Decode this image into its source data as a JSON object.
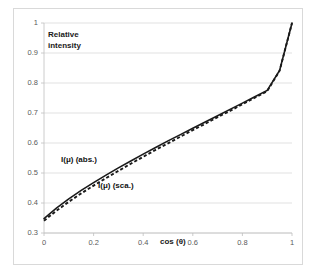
{
  "chart_data": {
    "type": "line",
    "title": "",
    "xlabel": "cos (θ)",
    "ylabel": "Relative intensity",
    "ylabel_line1": "Relative",
    "ylabel_line2": "intensity",
    "xlim": [
      0,
      1
    ],
    "ylim": [
      0.3,
      1
    ],
    "grid": true,
    "legend_position": "inline-annotations",
    "xticks": [
      "0",
      "0.2",
      "0.4",
      "0.6",
      "0.8",
      "1"
    ],
    "xtick_values": [
      0,
      0.2,
      0.4,
      0.6,
      0.8,
      1
    ],
    "yticks": [
      "0.3",
      "0.4",
      "0.5",
      "0.6",
      "0.7",
      "0.8",
      "0.9",
      "1"
    ],
    "ytick_values": [
      0.3,
      0.4,
      0.5,
      0.6,
      0.7,
      0.8,
      0.9,
      1
    ],
    "x": [
      0,
      0.05,
      0.1,
      0.15,
      0.2,
      0.25,
      0.3,
      0.35,
      0.4,
      0.45,
      0.5,
      0.55,
      0.6,
      0.65,
      0.7,
      0.75,
      0.8,
      0.85,
      0.9,
      0.95,
      1
    ],
    "series": [
      {
        "name": "I(μ)  (abs.)",
        "style": "solid",
        "color": "#1a1a1a",
        "label_text": "I(μ)  (abs.)",
        "values": [
          0.348,
          0.383,
          0.414,
          0.442,
          0.468,
          0.493,
          0.517,
          0.54,
          0.563,
          0.585,
          0.607,
          0.628,
          0.649,
          0.67,
          0.691,
          0.712,
          0.733,
          0.754,
          0.775,
          0.842,
          1.0
        ]
      },
      {
        "name": "I(μ)  (sca.)",
        "style": "dashed",
        "color": "#1a1a1a",
        "label_text": "I(μ)  (sca.)",
        "values": [
          0.341,
          0.374,
          0.404,
          0.432,
          0.458,
          0.483,
          0.507,
          0.531,
          0.554,
          0.577,
          0.599,
          0.621,
          0.643,
          0.664,
          0.686,
          0.707,
          0.729,
          0.751,
          0.773,
          0.841,
          1.0
        ]
      }
    ]
  }
}
